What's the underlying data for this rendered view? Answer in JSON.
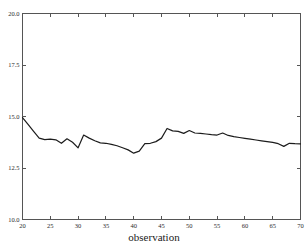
{
  "chart_data": {
    "type": "line",
    "title": "",
    "subtitle": "",
    "xlabel": "observation",
    "ylabel": "",
    "xlim": [
      20,
      70
    ],
    "ylim": [
      10.0,
      20.0
    ],
    "grid": false,
    "legend": null,
    "xticks": [
      20,
      25,
      30,
      35,
      40,
      45,
      50,
      55,
      60,
      65,
      70
    ],
    "xtick_labels": [
      "20",
      "25",
      "30",
      "35",
      "40",
      "45",
      "50",
      "55",
      "60",
      "65",
      "70"
    ],
    "yticks": [
      10.0,
      12.5,
      15.0,
      17.5,
      20.0
    ],
    "ytick_labels": [
      "10.0",
      "12.5",
      "15.0",
      "17.5",
      "20.0"
    ],
    "series": [
      {
        "name": "observation series",
        "color": "#1c1c1c",
        "x": [
          20,
          21,
          22,
          23,
          24,
          25,
          26,
          27,
          28,
          29,
          30,
          31,
          32,
          33,
          34,
          35,
          36,
          37,
          38,
          39,
          40,
          41,
          42,
          43,
          44,
          45,
          46,
          47,
          48,
          49,
          50,
          51,
          52,
          53,
          54,
          55,
          56,
          57,
          58,
          59,
          60,
          61,
          62,
          63,
          64,
          65,
          66,
          67,
          68,
          69,
          70
        ],
        "values": [
          14.95,
          14.62,
          14.28,
          13.95,
          13.88,
          13.9,
          13.87,
          13.7,
          13.92,
          13.75,
          13.48,
          14.1,
          13.95,
          13.82,
          13.72,
          13.7,
          13.65,
          13.58,
          13.48,
          13.38,
          13.22,
          13.32,
          13.68,
          13.7,
          13.78,
          13.95,
          14.42,
          14.3,
          14.28,
          14.18,
          14.32,
          14.2,
          14.18,
          14.15,
          14.12,
          14.1,
          14.2,
          14.08,
          14.02,
          13.98,
          13.94,
          13.9,
          13.86,
          13.82,
          13.78,
          13.74,
          13.68,
          13.55,
          13.7,
          13.68,
          13.67
        ]
      }
    ]
  },
  "axis": {
    "x_title": "observation"
  }
}
